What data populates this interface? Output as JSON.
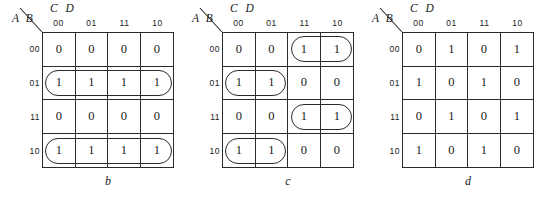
{
  "figure": {
    "row_variables": "A B",
    "col_variables": "C D",
    "col_headers": [
      "00",
      "01",
      "11",
      "10"
    ],
    "row_headers": [
      "00",
      "01",
      "11",
      "10"
    ],
    "line_color": "#2b2b2b",
    "text_color": "#1a1a1a",
    "background": "#ffffff"
  },
  "maps": [
    {
      "caption": "b",
      "rows": [
        [
          "0",
          "0",
          "0",
          "0"
        ],
        [
          "1",
          "1",
          "1",
          "1"
        ],
        [
          "0",
          "0",
          "0",
          "0"
        ],
        [
          "1",
          "1",
          "1",
          "1"
        ]
      ],
      "groups": [
        {
          "name": "group-row-01",
          "row": 1,
          "col": 0,
          "rowspan": 1,
          "colspan": 4
        },
        {
          "name": "group-row-10",
          "row": 3,
          "col": 0,
          "rowspan": 1,
          "colspan": 4
        }
      ]
    },
    {
      "caption": "c",
      "rows": [
        [
          "0",
          "0",
          "1",
          "1"
        ],
        [
          "1",
          "1",
          "0",
          "0"
        ],
        [
          "0",
          "0",
          "1",
          "1"
        ],
        [
          "1",
          "1",
          "0",
          "0"
        ]
      ],
      "groups": [
        {
          "name": "group-row-00-right",
          "row": 0,
          "col": 2,
          "rowspan": 1,
          "colspan": 2
        },
        {
          "name": "group-row-01-left",
          "row": 1,
          "col": 0,
          "rowspan": 1,
          "colspan": 2
        },
        {
          "name": "group-row-11-right",
          "row": 2,
          "col": 2,
          "rowspan": 1,
          "colspan": 2
        },
        {
          "name": "group-row-10-left",
          "row": 3,
          "col": 0,
          "rowspan": 1,
          "colspan": 2
        }
      ]
    },
    {
      "caption": "d",
      "rows": [
        [
          "0",
          "1",
          "0",
          "1"
        ],
        [
          "1",
          "0",
          "1",
          "0"
        ],
        [
          "0",
          "1",
          "0",
          "1"
        ],
        [
          "1",
          "0",
          "1",
          "0"
        ]
      ],
      "groups": []
    }
  ]
}
